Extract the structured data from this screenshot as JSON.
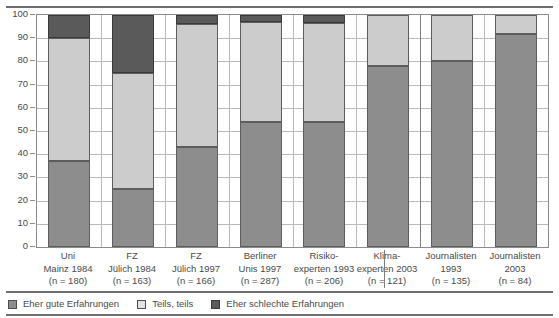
{
  "chart_data": {
    "type": "bar",
    "subtype": "stacked-column-100",
    "title": "",
    "xlabel": "",
    "ylabel": "",
    "ylim": [
      0,
      100
    ],
    "yticks": [
      0,
      10,
      20,
      30,
      40,
      50,
      60,
      70,
      80,
      90,
      100
    ],
    "ytick_labels": [
      "0",
      "10",
      "20",
      "30",
      "40",
      "50",
      "60",
      "70",
      "80",
      "90",
      "100"
    ],
    "grid": true,
    "legend_position": "bottom-left",
    "categories": [
      "Uni Mainz 1984 (n = 180)",
      "FZ Jülich 1984 (n = 163)",
      "FZ Jülich 1997 (n = 166)",
      "Berliner Unis 1997 (n = 287)",
      "Risiko-experten 1993 (n = 206)",
      "Klima-experten 2003 (n = 121)",
      "Journalisten 1993 (n = 135)",
      "Journalisten 2003 (n = 84)"
    ],
    "category_lines": [
      [
        "Uni",
        "Mainz 1984",
        "(n = 180)"
      ],
      [
        "FZ",
        "Jülich 1984",
        "(n = 163)"
      ],
      [
        "FZ",
        "Jülich 1997",
        "(n = 166)"
      ],
      [
        "Berliner",
        "Unis 1997",
        "(n = 287)"
      ],
      [
        "Risiko-",
        "experten 1993",
        "(n = 206)"
      ],
      [
        "Klima-",
        "experten 2003",
        "(n = 121)"
      ],
      [
        "Journalisten",
        "1993",
        "(n = 135)"
      ],
      [
        "Journalisten",
        "2003",
        "(n = 84)"
      ]
    ],
    "series": [
      {
        "name": "Eher gute Erfahrungen",
        "color": "#8d8d8d",
        "values": [
          37,
          25,
          43,
          54,
          54,
          78,
          80,
          92
        ]
      },
      {
        "name": "Teils, teils",
        "color": "#cccccc",
        "values": [
          53,
          50,
          53,
          43,
          42.5,
          22,
          20,
          8
        ]
      },
      {
        "name": "Eher schlechte Erfahrungen",
        "color": "#5a5a5a",
        "values": [
          10,
          25,
          4,
          3,
          3.5,
          0,
          0,
          0
        ]
      }
    ]
  },
  "legend": {
    "items": [
      {
        "label": "Eher gute Erfahrungen",
        "key": "good"
      },
      {
        "label": "Teils, teils",
        "key": "mid"
      },
      {
        "label": "Eher schlechte Erfahrungen",
        "key": "bad"
      }
    ]
  }
}
